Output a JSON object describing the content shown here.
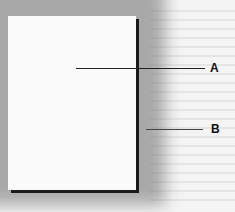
{
  "diagram": {
    "labels": {
      "a": "A",
      "b": "B"
    }
  }
}
